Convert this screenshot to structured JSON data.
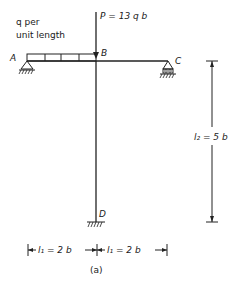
{
  "figure": {
    "caption": "(a)",
    "load_label_line1": "q   per",
    "load_label_line2": "unit length",
    "point_load": "P = 13 q b",
    "nodes": {
      "A": "A",
      "B": "B",
      "C": "C",
      "D": "D"
    },
    "dim_vertical": "l₂ = 5 b",
    "dim_left": "l₁ = 2 b",
    "dim_right": "l₁ = 2 b"
  }
}
